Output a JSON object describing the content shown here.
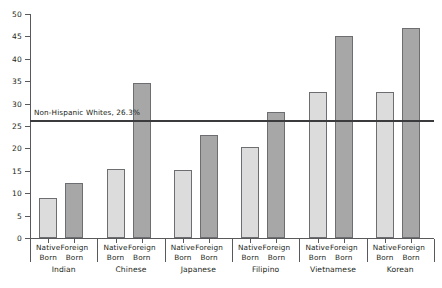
{
  "chart_data": {
    "type": "bar",
    "title": "",
    "subtitle": "",
    "xlabel": "",
    "ylabel": "",
    "ylim": [
      0,
      50
    ],
    "yticks": [
      0,
      5,
      10,
      15,
      20,
      25,
      30,
      35,
      40,
      45,
      50
    ],
    "grid": false,
    "legend_position": "none",
    "categories": [
      "Indian",
      "Chinese",
      "Japanese",
      "Filipino",
      "Vietnamese",
      "Korean"
    ],
    "subcategories": [
      "Native Born",
      "Foreign Born"
    ],
    "series": [
      {
        "name": "Native Born",
        "color": "#dcdcdc",
        "values": [
          8.9,
          15.4,
          15.1,
          20.3,
          32.6,
          32.6
        ]
      },
      {
        "name": "Foreign Born",
        "color": "#a7a7a7",
        "values": [
          12.3,
          34.6,
          22.9,
          28.1,
          45.1,
          46.9
        ]
      }
    ],
    "reference_line": {
      "value": 26.3,
      "label": "Non-Hispanic Whites, 26.3%",
      "color": "#3b3b3d"
    }
  },
  "axis": {
    "tick_labels": [
      "0",
      "5",
      "10",
      "15",
      "20",
      "25",
      "30",
      "35",
      "40",
      "45",
      "50"
    ]
  },
  "groups": [
    {
      "label": "Indian",
      "bars": [
        {
          "label_line1": "Native",
          "label_line2": "Born"
        },
        {
          "label_line1": "Foreign",
          "label_line2": "Born"
        }
      ]
    },
    {
      "label": "Chinese",
      "bars": [
        {
          "label_line1": "Native",
          "label_line2": "Born"
        },
        {
          "label_line1": "Foreign",
          "label_line2": "Born"
        }
      ]
    },
    {
      "label": "Japanese",
      "bars": [
        {
          "label_line1": "Native",
          "label_line2": "Born"
        },
        {
          "label_line1": "Foreign",
          "label_line2": "Born"
        }
      ]
    },
    {
      "label": "Filipino",
      "bars": [
        {
          "label_line1": "Native",
          "label_line2": "Born"
        },
        {
          "label_line1": "Foreign",
          "label_line2": "Born"
        }
      ]
    },
    {
      "label": "Vietnamese",
      "bars": [
        {
          "label_line1": "Native",
          "label_line2": "Born"
        },
        {
          "label_line1": "Foreign",
          "label_line2": "Born"
        }
      ]
    },
    {
      "label": "Korean",
      "bars": [
        {
          "label_line1": "Native",
          "label_line2": "Born"
        },
        {
          "label_line1": "Foreign",
          "label_line2": "Born"
        }
      ]
    }
  ]
}
